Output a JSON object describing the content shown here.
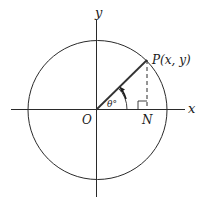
{
  "diagram": {
    "type": "unit-circle",
    "colors": {
      "stroke": "#2a2a2a",
      "background": "#ffffff"
    },
    "circle": {
      "cx": 97,
      "cy": 110,
      "r": 69.5
    },
    "axes": {
      "x_label": "x",
      "y_label": "y"
    },
    "labels": {
      "origin": "O",
      "point": "P(x, y)",
      "foot": "N",
      "angle": "θ°"
    },
    "features": [
      "radius OP",
      "dashed perpendicular PN",
      "right-angle marker at N",
      "angle arc with counterclockwise arrow"
    ]
  }
}
